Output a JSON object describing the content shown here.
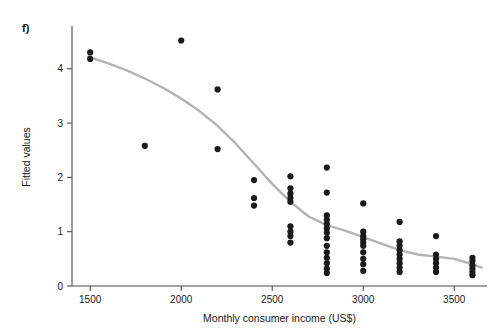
{
  "panel": {
    "label": "f)"
  },
  "chart_data": {
    "type": "scatter",
    "title": "",
    "xlabel": "Monthly consumer income (US$)",
    "ylabel": "Fitted values",
    "xlim": [
      1400,
      3680
    ],
    "ylim": [
      0,
      4.75
    ],
    "xticks": [
      1500,
      2000,
      2500,
      3000,
      3500
    ],
    "yticks": [
      0,
      1,
      2,
      3,
      4
    ],
    "grid": false,
    "legend": null,
    "point_color": "#1a1a1a",
    "line_color": "#b3b3b3",
    "axis_color": "#4d4d4d",
    "points": [
      [
        1500,
        4.3
      ],
      [
        1500,
        4.18
      ],
      [
        1800,
        2.58
      ],
      [
        2000,
        4.52
      ],
      [
        2200,
        3.62
      ],
      [
        2200,
        2.52
      ],
      [
        2400,
        1.95
      ],
      [
        2400,
        1.62
      ],
      [
        2400,
        1.48
      ],
      [
        2600,
        2.02
      ],
      [
        2600,
        1.8
      ],
      [
        2600,
        1.7
      ],
      [
        2600,
        1.62
      ],
      [
        2600,
        1.55
      ],
      [
        2600,
        1.1
      ],
      [
        2600,
        1.0
      ],
      [
        2600,
        0.92
      ],
      [
        2600,
        0.8
      ],
      [
        2800,
        2.18
      ],
      [
        2800,
        1.72
      ],
      [
        2800,
        1.3
      ],
      [
        2800,
        1.22
      ],
      [
        2800,
        1.14
      ],
      [
        2800,
        1.06
      ],
      [
        2800,
        0.98
      ],
      [
        2800,
        0.88
      ],
      [
        2800,
        0.74
      ],
      [
        2800,
        0.62
      ],
      [
        2800,
        0.52
      ],
      [
        2800,
        0.42
      ],
      [
        2800,
        0.32
      ],
      [
        2800,
        0.24
      ],
      [
        3000,
        1.52
      ],
      [
        3000,
        1.0
      ],
      [
        3000,
        0.92
      ],
      [
        3000,
        0.86
      ],
      [
        3000,
        0.8
      ],
      [
        3000,
        0.74
      ],
      [
        3000,
        0.62
      ],
      [
        3000,
        0.5
      ],
      [
        3000,
        0.4
      ],
      [
        3000,
        0.28
      ],
      [
        3200,
        1.18
      ],
      [
        3200,
        0.82
      ],
      [
        3200,
        0.74
      ],
      [
        3200,
        0.66
      ],
      [
        3200,
        0.58
      ],
      [
        3200,
        0.5
      ],
      [
        3200,
        0.42
      ],
      [
        3200,
        0.34
      ],
      [
        3200,
        0.26
      ],
      [
        3400,
        0.92
      ],
      [
        3400,
        0.58
      ],
      [
        3400,
        0.5
      ],
      [
        3400,
        0.42
      ],
      [
        3400,
        0.34
      ],
      [
        3400,
        0.26
      ],
      [
        3600,
        0.52
      ],
      [
        3600,
        0.46
      ],
      [
        3600,
        0.38
      ],
      [
        3600,
        0.32
      ],
      [
        3600,
        0.26
      ],
      [
        3600,
        0.2
      ]
    ],
    "fit_line": [
      [
        1490,
        4.22
      ],
      [
        1600,
        4.1
      ],
      [
        1700,
        3.97
      ],
      [
        1800,
        3.82
      ],
      [
        1900,
        3.65
      ],
      [
        2000,
        3.45
      ],
      [
        2100,
        3.22
      ],
      [
        2200,
        2.95
      ],
      [
        2300,
        2.62
      ],
      [
        2400,
        2.25
      ],
      [
        2500,
        1.88
      ],
      [
        2600,
        1.55
      ],
      [
        2700,
        1.28
      ],
      [
        2800,
        1.12
      ],
      [
        2900,
        1.02
      ],
      [
        3000,
        0.9
      ],
      [
        3100,
        0.78
      ],
      [
        3200,
        0.66
      ],
      [
        3300,
        0.58
      ],
      [
        3400,
        0.54
      ],
      [
        3500,
        0.5
      ],
      [
        3600,
        0.4
      ],
      [
        3650,
        0.34
      ]
    ]
  }
}
